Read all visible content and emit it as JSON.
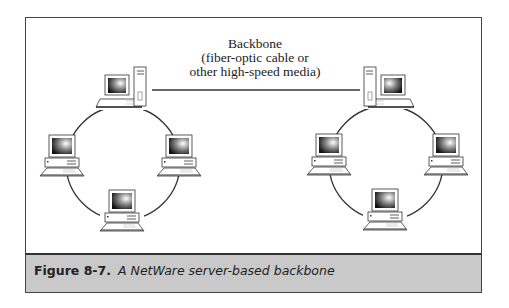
{
  "figure": {
    "backbone_label": {
      "line1": "Backbone",
      "line2": "(fiber-optic cable or",
      "line3": "other high-speed media)"
    },
    "caption": {
      "number": "Figure 8-7.",
      "text": "A NetWare server-based backbone"
    },
    "networks": [
      {
        "name": "left-ring",
        "server": "top",
        "workstations": [
          "left",
          "right",
          "bottom"
        ]
      },
      {
        "name": "right-ring",
        "server": "top",
        "workstations": [
          "left",
          "right",
          "bottom"
        ]
      }
    ],
    "colors": {
      "border": "#444444",
      "caption_bg": "#c9c9c9",
      "line": "#333333"
    }
  }
}
